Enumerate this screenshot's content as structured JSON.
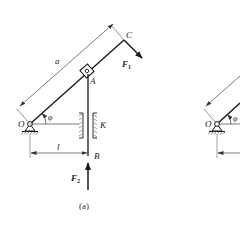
{
  "figure_a": {
    "caption": "(a)",
    "labels": {
      "C": "C",
      "A": "A",
      "O": "O",
      "K": "K",
      "B": "B",
      "a": "a",
      "l": "l",
      "phi": "φ",
      "F1": "F",
      "F1_sub": "1",
      "F2": "F",
      "F2_sub": "2"
    }
  },
  "figure_b_partial": {
    "labels": {
      "O": "O",
      "phi": "φ"
    }
  },
  "colors": {
    "line": "#2a2a2a",
    "dim_line": "#555555",
    "background": "#ffffff"
  }
}
